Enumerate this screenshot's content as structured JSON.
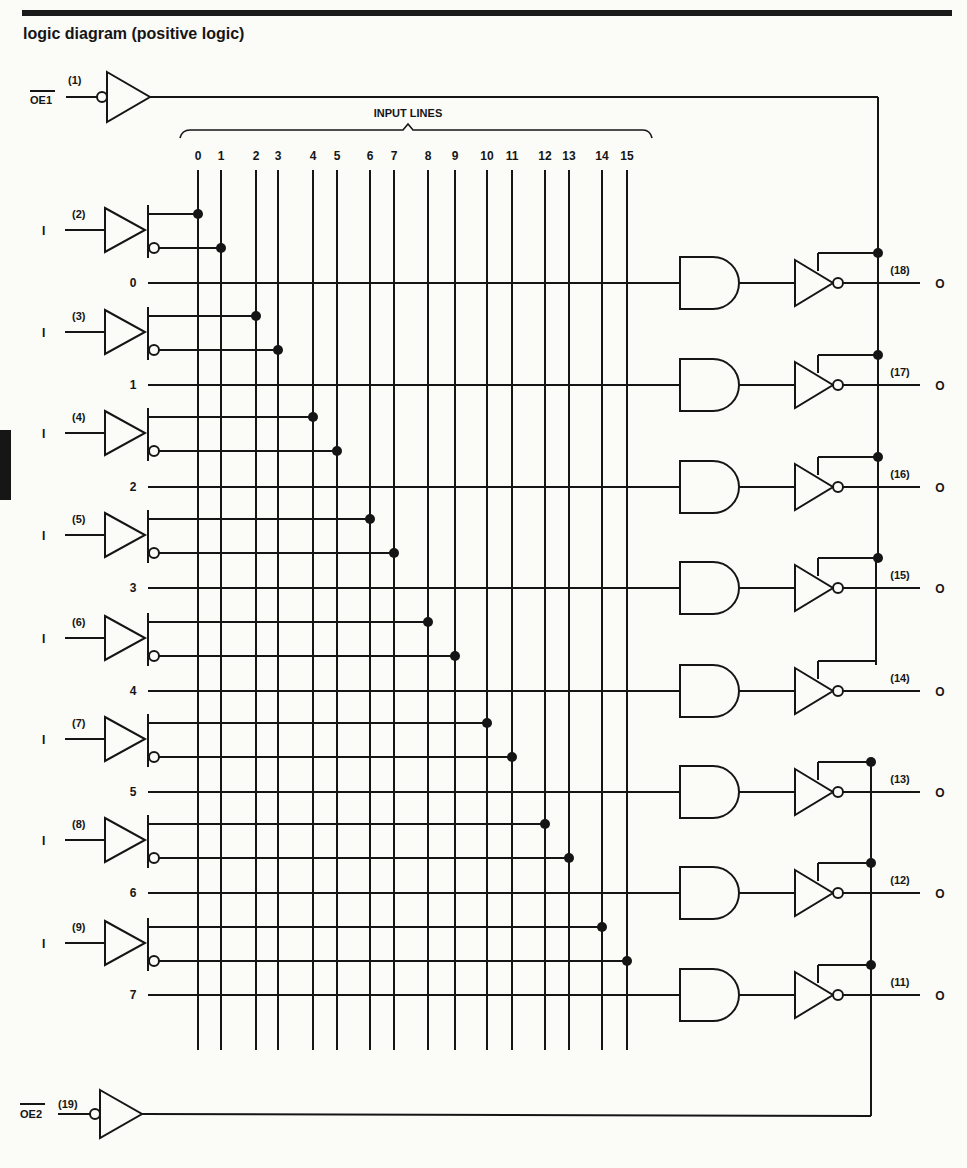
{
  "title": "logic diagram (positive logic)",
  "bus_label": "INPUT LINES",
  "enables": [
    {
      "name": "OE1",
      "pin": "(1)"
    },
    {
      "name": "OE2",
      "pin": "(19)"
    }
  ],
  "input_buffers": [
    {
      "label": "I",
      "pin": "(2)",
      "true_line": "0",
      "comp_line": "1"
    },
    {
      "label": "I",
      "pin": "(3)",
      "true_line": "2",
      "comp_line": "3"
    },
    {
      "label": "I",
      "pin": "(4)",
      "true_line": "4",
      "comp_line": "5"
    },
    {
      "label": "I",
      "pin": "(5)",
      "true_line": "6",
      "comp_line": "7"
    },
    {
      "label": "I",
      "pin": "(6)",
      "true_line": "8",
      "comp_line": "9"
    },
    {
      "label": "I",
      "pin": "(7)",
      "true_line": "10",
      "comp_line": "11"
    },
    {
      "label": "I",
      "pin": "(8)",
      "true_line": "12",
      "comp_line": "13"
    },
    {
      "label": "I",
      "pin": "(9)",
      "true_line": "14",
      "comp_line": "15"
    }
  ],
  "input_lines": [
    "0",
    "1",
    "2",
    "3",
    "4",
    "5",
    "6",
    "7",
    "8",
    "9",
    "10",
    "11",
    "12",
    "13",
    "14",
    "15"
  ],
  "product_terms": [
    "0",
    "1",
    "2",
    "3",
    "4",
    "5",
    "6",
    "7"
  ],
  "outputs": [
    {
      "label": "O",
      "pin": "(18)",
      "enable": "OE1"
    },
    {
      "label": "O",
      "pin": "(17)",
      "enable": "OE1"
    },
    {
      "label": "O",
      "pin": "(16)",
      "enable": "OE1"
    },
    {
      "label": "O",
      "pin": "(15)",
      "enable": "OE1"
    },
    {
      "label": "O",
      "pin": "(14)",
      "enable": "OE2"
    },
    {
      "label": "O",
      "pin": "(13)",
      "enable": "OE2"
    },
    {
      "label": "O",
      "pin": "(12)",
      "enable": "OE2"
    },
    {
      "label": "O",
      "pin": "(11)",
      "enable": "OE2"
    }
  ],
  "colors": {
    "ink": "#151515",
    "paper": "#fbfbf8"
  }
}
